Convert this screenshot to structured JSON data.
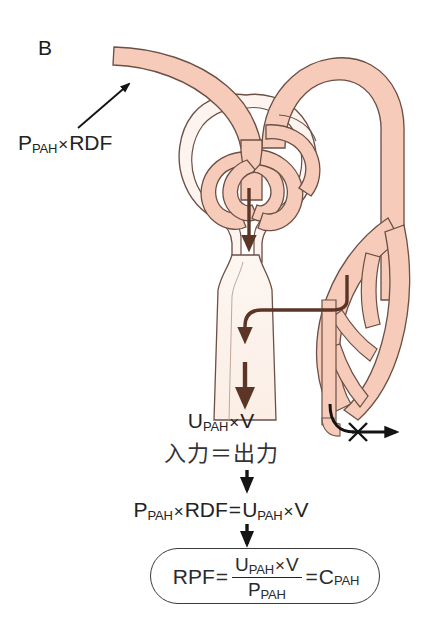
{
  "figure": {
    "panel_label": "B",
    "title_hidden": "",
    "colors": {
      "vessel_fill": "#f7cbba",
      "vessel_stroke": "#5d4037",
      "tubule_fill": "#fbefe8",
      "tubule_stroke": "#5d4037",
      "bowman_fill": "#fdf3ee",
      "flow_arrow": "#5b3526",
      "text": "#232323",
      "box_stroke": "#3a3a3a",
      "background": "#ffffff"
    }
  },
  "labels": {
    "plasma_input": {
      "main1": "P",
      "sub1": "PAH",
      "times": "×",
      "main2": "RDF"
    },
    "urine_output": {
      "main1": "U",
      "sub1": "PAH",
      "times": "×",
      "main2": "V"
    },
    "input_equals_output": "入力＝出力",
    "balance_equation": {
      "p": "P",
      "p_sub": "PAH",
      "times1": "×",
      "rdf": "RDF",
      "equals": "=",
      "u": "U",
      "u_sub": "PAH",
      "times2": "×",
      "v": "V"
    },
    "result": {
      "rpf": "RPF",
      "equals1": "=",
      "numer_u": "U",
      "numer_sub": "PAH",
      "numer_times": "×",
      "numer_v": "V",
      "denom_p": "P",
      "denom_sub": "PAH",
      "equals2": "=",
      "c": "C",
      "c_sub": "PAH"
    }
  },
  "anatomy": {
    "afferent_arteriole": "afferent-arteriole",
    "efferent_arteriole": "efferent-arteriole",
    "glomerular_tuft": "glomerular-capillary-tuft",
    "bowmans_capsule": "bowmans-capsule",
    "renal_tubule": "renal-tubule",
    "peritubular_capillaries": "peritubular-capillary-network",
    "collecting_duct": "collecting-duct"
  },
  "arrows": {
    "inflow_pointer": "thin-arrow-into-afferent-arteriole",
    "filtration": "filtration-arrow-down",
    "secretion": "secretion-arrow-into-tubule",
    "excretion": "excretion-arrow-down-tubule",
    "no_return": "blocked-return-arrow-with-x",
    "flow_1": "down-arrow-to-balance-equation",
    "flow_2": "down-arrow-to-result-box"
  }
}
